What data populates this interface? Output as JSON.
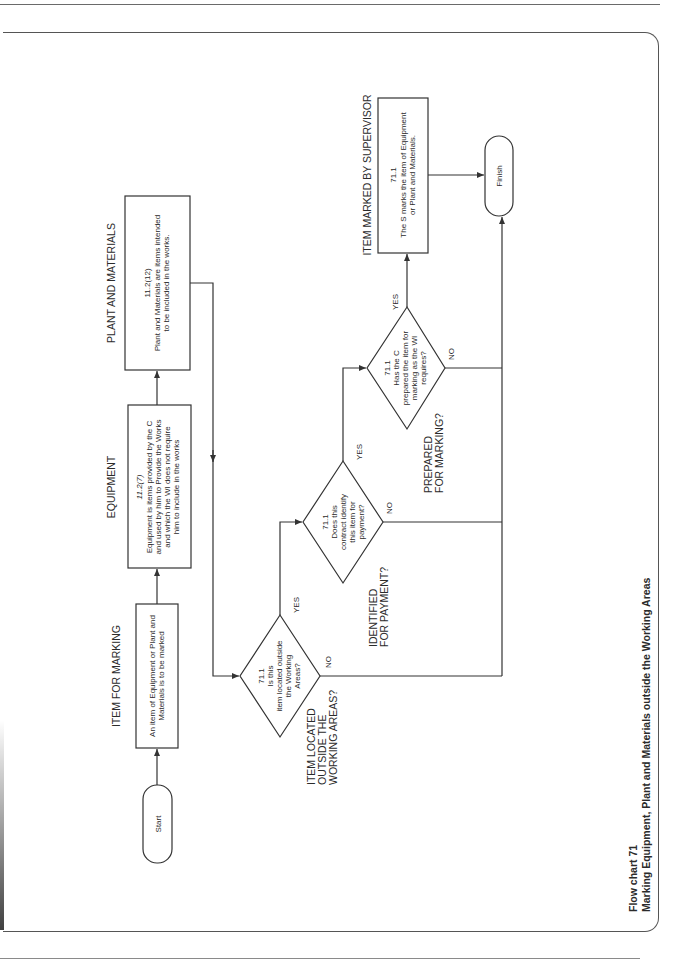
{
  "caption": {
    "number": "Flow chart 71",
    "title": "Marking Equipment, Plant and Materials outside the Working Areas"
  },
  "terminals": {
    "start": "Start",
    "finish": "Finish"
  },
  "process_boxes": {
    "item_for_marking": {
      "heading": "ITEM FOR MARKING",
      "lines": [
        "An item of Equipment or Plant and",
        "Materials is to be marked"
      ]
    },
    "equipment": {
      "heading": "EQUIPMENT",
      "ref": "11.2(7)",
      "lines": [
        "Equipment is items provided by the C",
        "and used by him to Provide the Works",
        "and which the WI does not require",
        "him to include in the works"
      ]
    },
    "plant_and_materials": {
      "heading": "PLANT AND MATERIALS",
      "ref": "11.2(12)",
      "lines": [
        "Plant and Materials are items intended",
        "to be included in the works."
      ]
    },
    "item_marked_by_supervisor": {
      "heading": "ITEM MARKED BY SUPERVISOR",
      "ref": "71.1",
      "lines": [
        "The S marks the item of Equipment",
        "or Plant and Materials."
      ]
    }
  },
  "decisions": {
    "located_outside": {
      "heading_lines": [
        "ITEM LOCATED",
        "OUTSIDE THE",
        "WORKING AREAS?"
      ],
      "ref": "71.1",
      "lines": [
        "Is this",
        "item located outside",
        "the Working",
        "Areas?"
      ],
      "yes": "YES",
      "no": "NO"
    },
    "identified_for_payment": {
      "heading_lines": [
        "IDENTIFIED",
        "FOR PAYMENT?"
      ],
      "ref": "71.1",
      "lines": [
        "Does this",
        "contract identify",
        "this item for",
        "payment?"
      ],
      "yes": "YES",
      "no": "NO"
    },
    "prepared_for_marking": {
      "heading_lines": [
        "PREPARED",
        "FOR MARKING?"
      ],
      "ref": "71.1",
      "lines": [
        "Has the C",
        "prepared the item for",
        "marking as the WI",
        "requires?"
      ],
      "yes": "YES",
      "no": "NO"
    }
  },
  "colors": {
    "line": "#333333",
    "text": "#2b2b2b",
    "background": "#ffffff"
  }
}
